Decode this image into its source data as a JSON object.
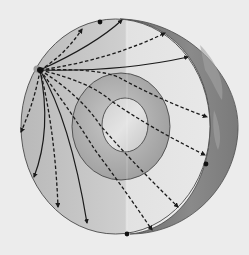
{
  "diagram": {
    "subject": "Seismic wave paths through Earth's interior",
    "background_color": "#ececec",
    "colors": {
      "mantle_light": "#d6d6d6",
      "mantle_dark": "#b4b4b4",
      "outer_core_light": "#bdbdbd",
      "outer_core_dark": "#9c9c9c",
      "inner_core_light": "#dadada",
      "inner_core_dark": "#c4c4c4",
      "surface": "#7a7a7a",
      "ray": "#1a1a1a",
      "boundary": "#4a4a4a"
    },
    "layers": [
      {
        "name": "mantle",
        "shape": "ellipse",
        "cx": 115.5,
        "cy": 126.5,
        "rx": 94.5,
        "ry": 107.5
      },
      {
        "name": "outer-core",
        "shape": "ellipse",
        "cx": 121,
        "cy": 126.5,
        "rx": 49,
        "ry": 53.5
      },
      {
        "name": "inner-core",
        "shape": "ellipse",
        "cx": 125,
        "cy": 125,
        "rx": 23,
        "ry": 27
      }
    ],
    "focus": {
      "label": "earthquake focus",
      "x": 40,
      "y": 70
    },
    "stations": [
      {
        "x": 100,
        "y": 22
      },
      {
        "x": 206,
        "y": 164
      },
      {
        "x": 127,
        "y": 234
      }
    ],
    "rays": [
      {
        "type": "solid",
        "d": "M40,70 Q95,45 122,20"
      },
      {
        "type": "dashed",
        "d": "M40,70 Q65,55 82,29"
      },
      {
        "type": "dashed",
        "d": "M40,70 Q110,60 165,33"
      },
      {
        "type": "solid",
        "d": "M40,70 Q120,72 188,57"
      },
      {
        "type": "dashed",
        "d": "M40,70 Q100,68 120,78 Q160,100 207,117"
      },
      {
        "type": "dashed",
        "d": "M40,70 Q90,82 110,100 Q150,128 205,155"
      },
      {
        "type": "dashed",
        "d": "M40,70 Q80,95 100,125 Q130,160 178,207"
      },
      {
        "type": "dashed",
        "d": "M40,70 Q70,110 95,150 Q125,190 152,230"
      },
      {
        "type": "solid",
        "d": "M40,70 Q70,120 87,223"
      },
      {
        "type": "dashed",
        "d": "M40,70 Q55,130 58,207"
      },
      {
        "type": "solid",
        "d": "M40,70 Q52,130 34,177"
      },
      {
        "type": "dashed",
        "d": "M40,70 Q35,100 21,132"
      }
    ]
  }
}
